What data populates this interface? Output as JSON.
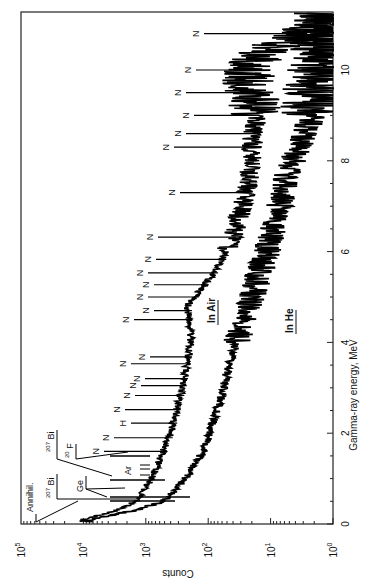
{
  "chart_data": {
    "type": "line",
    "orientation": "rotated-90-clockwise",
    "title": "",
    "xlabel": "Gamma-ray energy,  MeV",
    "ylabel": "Counts",
    "xlim": [
      0,
      11.3
    ],
    "ylim": [
      1,
      100000
    ],
    "yscale": "log",
    "x_ticks": [
      "0",
      "2",
      "4",
      "6",
      "8",
      "10"
    ],
    "y_ticks": [
      {
        "base": "10",
        "exp": "0"
      },
      {
        "base": "10",
        "exp": "1"
      },
      {
        "base": "10",
        "exp": "2"
      },
      {
        "base": "10",
        "exp": "3"
      },
      {
        "base": "10",
        "exp": "4"
      },
      {
        "base": "10",
        "exp": "5"
      }
    ],
    "grid": false,
    "series": [
      {
        "name": "In Air",
        "x": [
          0.1,
          0.3,
          0.5,
          1.0,
          2.0,
          3.0,
          4.0,
          4.8,
          5.5,
          6.0,
          7.1,
          7.8,
          8.2,
          9.1,
          9.8,
          10.4,
          10.8,
          11.2
        ],
        "y": [
          10000,
          3000,
          1400,
          800,
          400,
          260,
          190,
          215,
          83,
          50,
          27,
          21,
          20,
          17,
          24,
          14,
          3,
          1.5
        ]
      },
      {
        "name": "In He",
        "x": [
          0.1,
          0.3,
          0.5,
          1.0,
          1.6,
          2.7,
          3.3,
          3.8,
          4.7,
          6.1,
          7.8,
          9.1,
          10.0,
          11.0
        ],
        "y": [
          8000,
          1500,
          520,
          230,
          120,
          65,
          50,
          40,
          24,
          11,
          5,
          2,
          1.6,
          1.2
        ]
      }
    ],
    "annotations": [
      {
        "text": "Annihil.",
        "energy": 0.511
      },
      {
        "text": "207Bi",
        "energy": 0.57
      },
      {
        "text": "207Bi",
        "energy": 1.06
      },
      {
        "text": "Ge",
        "energy": 0.6
      },
      {
        "text": "20F",
        "energy": 1.63
      },
      {
        "text": "Ar",
        "energy": 1.3
      },
      {
        "text": "N",
        "energy": 1.6
      },
      {
        "text": "N",
        "energy": 1.9
      },
      {
        "text": "H",
        "energy": 2.22
      },
      {
        "text": "N",
        "energy": 2.52
      },
      {
        "text": "N",
        "energy": 2.83
      },
      {
        "text": "N",
        "energy": 3.05
      },
      {
        "text": "N",
        "energy": 3.2
      },
      {
        "text": "N",
        "energy": 3.53
      },
      {
        "text": "N",
        "energy": 3.68
      },
      {
        "text": "N",
        "energy": 4.5
      },
      {
        "text": "N",
        "energy": 4.7
      },
      {
        "text": "N",
        "energy": 5.0
      },
      {
        "text": "N",
        "energy": 5.27
      },
      {
        "text": "N",
        "energy": 5.53
      },
      {
        "text": "N",
        "energy": 5.83
      },
      {
        "text": "N",
        "energy": 6.32
      },
      {
        "text": "N",
        "energy": 7.3
      },
      {
        "text": "N",
        "energy": 8.3
      },
      {
        "text": "N",
        "energy": 8.6
      },
      {
        "text": "N",
        "energy": 9.0
      },
      {
        "text": "N",
        "energy": 9.5
      },
      {
        "text": "N",
        "energy": 10.0
      },
      {
        "text": "N",
        "energy": 10.8
      }
    ],
    "curve_labels": [
      {
        "text": "In Air",
        "series": "In Air"
      },
      {
        "text": "In He",
        "series": "In He"
      }
    ]
  },
  "labels": {
    "xlabel": "Gamma-ray energy,  MeV",
    "ylabel": "Counts",
    "in_air": "In Air",
    "in_he": "In He",
    "annihil": "Annihil.",
    "bi": "Bi",
    "bi_mass": "207",
    "ge": "Ge",
    "f": "F",
    "f_mass": "20",
    "ar": "Ar",
    "h": "H",
    "n": "N"
  }
}
